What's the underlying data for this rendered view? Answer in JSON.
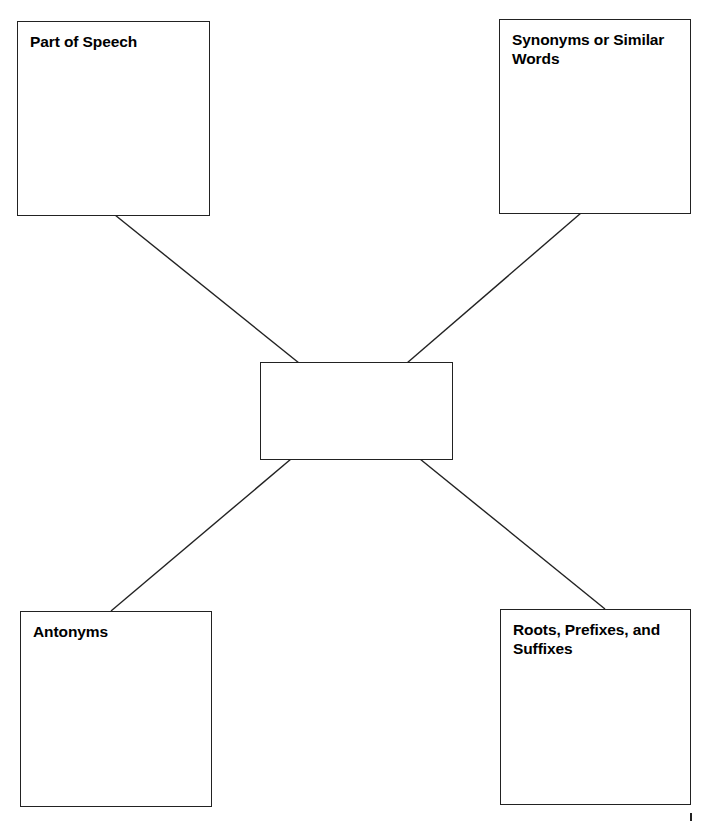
{
  "diagram": {
    "type": "word-map graphic organizer",
    "center": {
      "label": ""
    },
    "boxes": {
      "top_left": {
        "label": "Part of Speech"
      },
      "top_right": {
        "label": "Synonyms or Similar Words"
      },
      "bottom_left": {
        "label": "Antonyms"
      },
      "bottom_right": {
        "label": "Roots, Prefixes, and Suffixes"
      }
    },
    "colors": {
      "stroke": "#222222",
      "background": "#ffffff",
      "text": "#000000"
    }
  }
}
